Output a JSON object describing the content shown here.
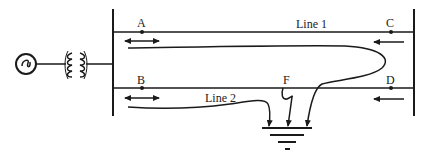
{
  "diagram": {
    "type": "power-system-fault-current-paths",
    "labels": {
      "point_a": "A",
      "point_b": "B",
      "point_c": "C",
      "point_d": "D",
      "point_f": "F",
      "line_1": "Line 1",
      "line_2": "Line 2"
    },
    "components": {
      "generator": "generator-ac-source",
      "transformer": "transformer-coils",
      "left_busbar": "busbar-left",
      "right_busbar": "busbar-right",
      "ground": "ground-earth-symbol"
    },
    "arrows": {
      "a_arrow": "bidirectional",
      "b_arrow": "bidirectional",
      "c_arrow": "left",
      "d_arrow": "left"
    },
    "colors": {
      "stroke": "#1a1a1a",
      "background": "#ffffff"
    }
  }
}
